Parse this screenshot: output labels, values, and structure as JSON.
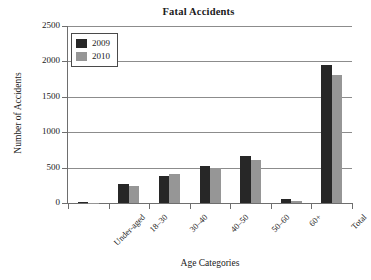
{
  "chart_data": {
    "type": "bar",
    "title": "Fatal Accidents",
    "xlabel": "Age Categories",
    "ylabel": "Number of Accidents",
    "categories": [
      "Under-aged",
      "18–30",
      "30–40",
      "40–50",
      "50–60",
      "60+",
      "Total"
    ],
    "series": [
      {
        "name": "2009",
        "color": "#272727",
        "values": [
          10,
          275,
          385,
          520,
          665,
          60,
          1945
        ]
      },
      {
        "name": "2010",
        "color": "#969696",
        "values": [
          5,
          245,
          405,
          490,
          610,
          35,
          1815
        ]
      }
    ],
    "ylim": [
      0,
      2500
    ],
    "yticks": [
      0,
      500,
      1000,
      1500,
      2000,
      2500
    ],
    "ytick_labels": [
      "0",
      "500",
      "1000",
      "1500",
      "2000",
      "2500"
    ],
    "grid": true,
    "legend_position": "top-left"
  }
}
